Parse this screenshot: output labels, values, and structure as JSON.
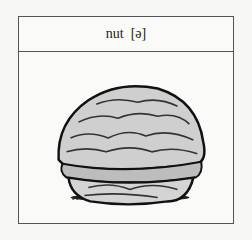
{
  "card": {
    "word": "nut",
    "phoneme": "[ə]",
    "illustration": "walnut-illustration"
  }
}
